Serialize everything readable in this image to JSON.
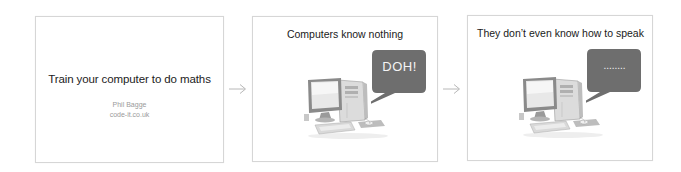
{
  "slides": [
    {
      "title": "Train your computer to do maths",
      "author": "Phil Bagge",
      "site": "code-it.co.uk"
    },
    {
      "title": "Computers know nothing",
      "bubble_text": "DOH!",
      "image": "desktop-computer-illustration"
    },
    {
      "title": "They don’t even know how to speak",
      "bubble_text": "........",
      "image": "desktop-computer-illustration"
    }
  ],
  "connectors": [
    "arrow-right-icon",
    "arrow-right-icon"
  ],
  "colors": {
    "slide_border": "#d6d6d6",
    "bubble_fill": "#6e6e6e",
    "arrow": "#b8b8b8",
    "title_text": "#1a1a1a",
    "subtitle_text": "#9a9a9a"
  }
}
